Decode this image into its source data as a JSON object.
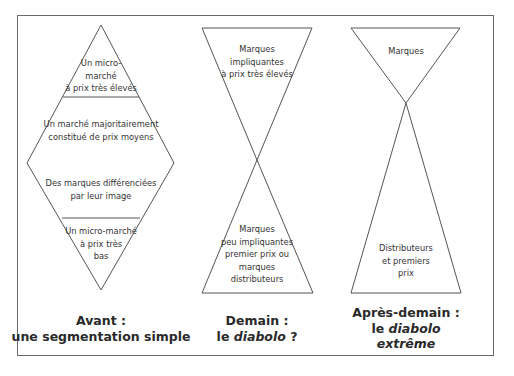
{
  "diagram": {
    "panels": [
      {
        "id": "avant",
        "shape": "diamond",
        "segments": [
          {
            "lines": [
              "Un micro-",
              "marché",
              "à prix très élevés"
            ]
          },
          {
            "lines": [
              "Un marché majoritairement",
              "constitué de prix moyens"
            ]
          },
          {
            "lines": [
              "Des marques différenciées",
              "par leur image"
            ]
          },
          {
            "lines": [
              "Un micro-marché",
              "à prix très",
              "bas"
            ]
          }
        ],
        "caption": {
          "line1": "Avant :",
          "line2": "une segmentation simple"
        }
      },
      {
        "id": "demain",
        "shape": "diabolo",
        "segments": [
          {
            "lines": [
              "Marques",
              "impliquantes",
              "à prix très élevés"
            ]
          },
          {
            "lines": [
              "Marques",
              "peu impliquantes",
              "premier prix ou",
              "marques",
              "distributeurs"
            ]
          }
        ],
        "caption": {
          "line1": "Demain :",
          "line2_plain": "le ",
          "line2_italic": "diabolo",
          "line2_end": " ?"
        }
      },
      {
        "id": "apres-demain",
        "shape": "diabolo-extreme",
        "segments": [
          {
            "lines": [
              "Marques"
            ]
          },
          {
            "lines": [
              "Distributeurs",
              "et premiers",
              "prix"
            ]
          }
        ],
        "caption": {
          "line1": "Après-demain :",
          "line2_plain": "le ",
          "line2_italic": "diabolo",
          "line3": "extrême"
        }
      }
    ],
    "colors": {
      "stroke": "#555555",
      "frame": "#6a6a6a",
      "text": "#2a2a2a",
      "background": "#ffffff"
    }
  }
}
